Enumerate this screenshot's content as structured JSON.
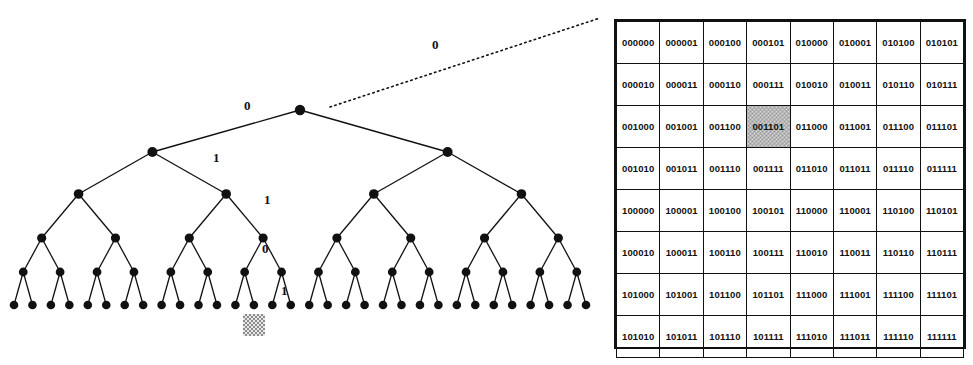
{
  "figure": {
    "kind": "binary-code-tree-and-grid",
    "accent_color": "#111111",
    "highlight_color": "#8d8d8d"
  },
  "tree": {
    "depth": 5,
    "leaf_count": 32,
    "node_color": "#111111",
    "edge_color": "#111111",
    "root_incoming_edge": {
      "style": "dotted",
      "label": "0"
    },
    "path_labels": [
      {
        "id": "label-0",
        "text": "0",
        "x": 244,
        "y": 106
      },
      {
        "id": "label-1",
        "text": "1",
        "x": 213,
        "y": 158
      },
      {
        "id": "label-2",
        "text": "1",
        "x": 264,
        "y": 200
      },
      {
        "id": "label-3",
        "text": "0",
        "x": 262,
        "y": 249
      },
      {
        "id": "label-4",
        "text": "1",
        "x": 280,
        "y": 291
      }
    ],
    "selected_path": "0 1 1 0 1",
    "selected_leaf_index": 13,
    "leaf_marker": {
      "x": 266,
      "y": 314,
      "size": 22
    }
  },
  "code_table": {
    "rows": 8,
    "cols": 8,
    "highlighted_cell": {
      "row": 2,
      "col": 3,
      "value": "001101"
    },
    "values": [
      [
        "000000",
        "000001",
        "000100",
        "000101",
        "010000",
        "010001",
        "010100",
        "010101"
      ],
      [
        "000010",
        "000011",
        "000110",
        "000111",
        "010010",
        "010011",
        "010110",
        "010111"
      ],
      [
        "001000",
        "001001",
        "001100",
        "001101",
        "011000",
        "011001",
        "011100",
        "011101"
      ],
      [
        "001010",
        "001011",
        "001110",
        "001111",
        "011010",
        "011011",
        "011110",
        "011111"
      ],
      [
        "100000",
        "100001",
        "100100",
        "100101",
        "110000",
        "110001",
        "110100",
        "110101"
      ],
      [
        "100010",
        "100011",
        "100110",
        "100111",
        "110010",
        "110011",
        "110110",
        "110111"
      ],
      [
        "101000",
        "101001",
        "101100",
        "101101",
        "111000",
        "111001",
        "111100",
        "111101"
      ],
      [
        "101010",
        "101011",
        "101110",
        "101111",
        "111010",
        "111011",
        "111110",
        "111111"
      ]
    ]
  }
}
